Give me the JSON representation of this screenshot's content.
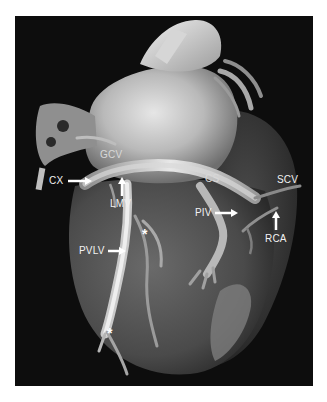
{
  "figure": {
    "background_color": "#0d0d0d",
    "labels": {
      "gcv": "GCV",
      "cx": "CX",
      "lmv": "LMV",
      "cs": "CS",
      "scv": "SCV",
      "piv": "PIV",
      "rca": "RCA",
      "pvlv": "PVLV",
      "asterisk_1": "*",
      "asterisk_2": "*"
    },
    "arrows": [
      {
        "points_to": "CX",
        "direction": "right"
      },
      {
        "points_to": "LMV",
        "direction": "up"
      },
      {
        "points_to": "PIV",
        "direction": "right"
      },
      {
        "points_to": "RCA",
        "direction": "up"
      },
      {
        "points_to": "PVLV",
        "direction": "right"
      }
    ]
  }
}
